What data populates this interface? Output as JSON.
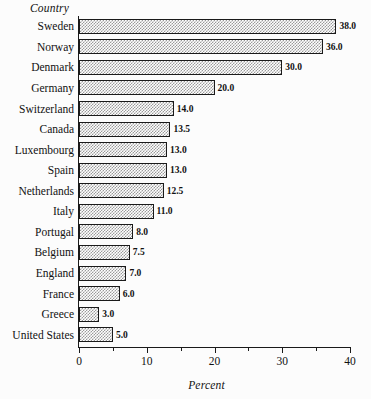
{
  "chart_data": {
    "type": "bar",
    "orientation": "horizontal",
    "title": "",
    "xlabel": "Percent",
    "ylabel": "Country",
    "xlim": [
      0,
      40
    ],
    "grid": false,
    "legend": null,
    "xticks": [
      0,
      10,
      20,
      30,
      40
    ],
    "xtick_labels": [
      "0",
      "10",
      "20",
      "30",
      "40"
    ],
    "minor_xticks": [
      5,
      15,
      25,
      35
    ],
    "categories": [
      "Sweden",
      "Norway",
      "Denmark",
      "Germany",
      "Switzerland",
      "Canada",
      "Luxembourg",
      "Spain",
      "Netherlands",
      "Italy",
      "Portugal",
      "Belgium",
      "England",
      "France",
      "Greece",
      "United States"
    ],
    "values": [
      38.0,
      36.0,
      30.0,
      20.0,
      14.0,
      13.5,
      13.0,
      13.0,
      12.5,
      11.0,
      8.0,
      7.5,
      7.0,
      6.0,
      3.0,
      5.0
    ],
    "value_labels": [
      "38.0",
      "36.0",
      "30.0",
      "20.0",
      "14.0",
      "13.5",
      "13.0",
      "13.0",
      "12.5",
      "11.0",
      "8.0",
      "7.5",
      "7.0",
      "6.0",
      "3.0",
      "5.0"
    ],
    "bar_fill": "#9a9a9a",
    "bar_edge": "#1a1a1a",
    "background": "#fcfcfc"
  }
}
